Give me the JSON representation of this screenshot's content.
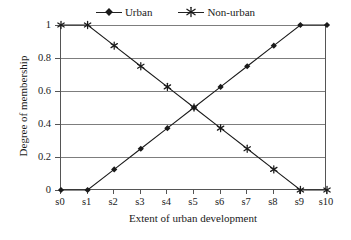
{
  "chart_data": {
    "type": "line",
    "title": "",
    "xlabel": "Extent of urban development",
    "ylabel": "Degree of membership",
    "categories": [
      "s0",
      "s1",
      "s2",
      "s3",
      "s4",
      "s5",
      "s6",
      "s7",
      "s8",
      "s9",
      "s10"
    ],
    "ylim": [
      0,
      1
    ],
    "yticks": [
      "0",
      "0.2",
      "0.4",
      "0.6",
      "0.8",
      "1"
    ],
    "ytick_values": [
      0,
      0.2,
      0.4,
      0.6,
      0.8,
      1
    ],
    "grid": true,
    "legend_position": "top-center",
    "series": [
      {
        "name": "Urban",
        "marker": "diamond",
        "color": "#1a1a1a",
        "values": [
          0,
          0,
          0.125,
          0.25,
          0.375,
          0.5,
          0.625,
          0.75,
          0.875,
          1,
          1
        ]
      },
      {
        "name": "Non-urban",
        "marker": "asterisk",
        "color": "#1a1a1a",
        "values": [
          1,
          1,
          0.875,
          0.75,
          0.625,
          0.5,
          0.375,
          0.25,
          0.125,
          0,
          0
        ]
      }
    ]
  },
  "legend": {
    "items": [
      {
        "label": "Urban",
        "marker": "diamond-marker-icon"
      },
      {
        "label": "Non-urban",
        "marker": "asterisk-marker-icon"
      }
    ]
  },
  "axes": {
    "x_title": "Extent of urban development",
    "y_title": "Degree of membership"
  }
}
